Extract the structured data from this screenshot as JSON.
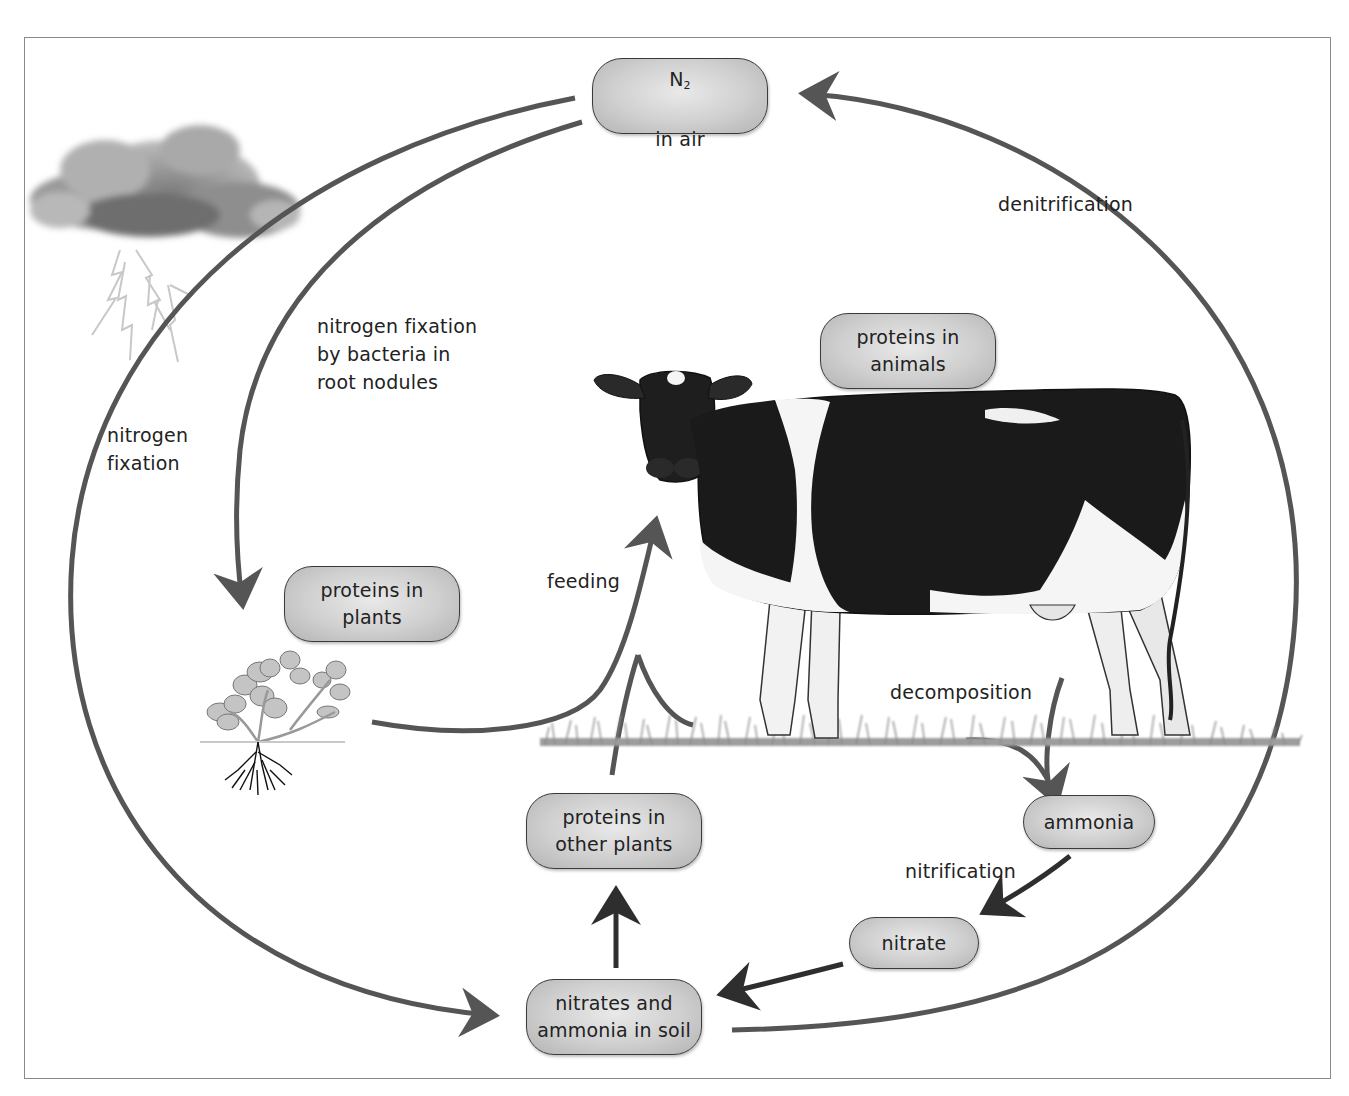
{
  "diagram": {
    "nodes": {
      "n2_air": {
        "formula_main": "N",
        "formula_sub": "2",
        "line2": "in air"
      },
      "proteins_animals": {
        "text": "proteins in\nanimals"
      },
      "proteins_plants": {
        "text": "proteins in\nplants"
      },
      "proteins_other_plants": {
        "text": "proteins in\nother plants"
      },
      "nitrates_ammonia_soil": {
        "text": "nitrates and\nammonia in soil"
      },
      "ammonia": {
        "text": "ammonia"
      },
      "nitrate": {
        "text": "nitrate"
      }
    },
    "process_labels": {
      "denitrification": "denitrification",
      "fixation_bacteria": "nitrogen fixation\nby bacteria in\nroot nodules",
      "nitrogen_fixation": "nitrogen\nfixation",
      "feeding": "feeding",
      "decomposition": "decomposition",
      "nitrification": "nitrification"
    },
    "edges": [
      {
        "from": "N2 in air",
        "to": "nitrates and ammonia in soil",
        "label": "nitrogen fixation"
      },
      {
        "from": "N2 in air",
        "to": "proteins in plants",
        "label": "nitrogen fixation by bacteria in root nodules"
      },
      {
        "from": "proteins in plants",
        "to": "proteins in animals",
        "label": "feeding"
      },
      {
        "from": "proteins in other plants",
        "to": "proteins in animals",
        "label": "feeding"
      },
      {
        "from": "nitrates and ammonia in soil",
        "to": "proteins in other plants",
        "label": ""
      },
      {
        "from": "proteins in animals",
        "to": "ammonia",
        "label": "decomposition"
      },
      {
        "from": "ammonia",
        "to": "nitrate",
        "label": "nitrification"
      },
      {
        "from": "nitrate",
        "to": "nitrates and ammonia in soil",
        "label": ""
      },
      {
        "from": "nitrates and ammonia in soil",
        "to": "N2 in air",
        "label": "denitrification"
      }
    ],
    "illustrations": [
      "storm-cloud-with-lightning",
      "clover-plant-with-roots",
      "holstein-cow",
      "grass"
    ],
    "colors": {
      "arrow": "#555555",
      "arrow_dark": "#2e2e2e",
      "node_fill": "#cfcfcf",
      "node_border": "#3a3a3a",
      "frame": "#8a8a8a"
    }
  }
}
